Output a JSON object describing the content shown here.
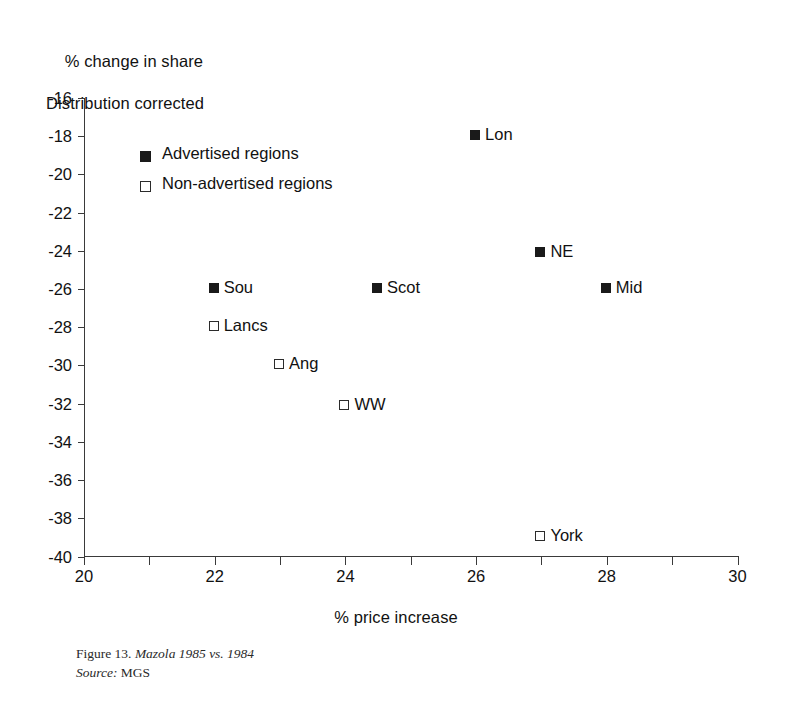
{
  "chart_data": {
    "type": "scatter",
    "title": "",
    "ylabel_line1": "% change in share",
    "ylabel_line2": "Distribution corrected",
    "xlabel": "% price increase",
    "xlim": [
      20,
      30
    ],
    "ylim": [
      -40,
      -16
    ],
    "xticks": [
      20,
      21,
      22,
      23,
      24,
      25,
      26,
      27,
      28,
      29,
      30
    ],
    "xtick_labels": [
      "20",
      "",
      "22",
      "",
      "24",
      "",
      "26",
      "",
      "28",
      "",
      "30"
    ],
    "yticks": [
      -16,
      -18,
      -20,
      -22,
      -24,
      -26,
      -28,
      -30,
      -32,
      -34,
      -36,
      -38,
      -40
    ],
    "ytick_labels": [
      "-16",
      "-18",
      "-20",
      "-22",
      "-24",
      "-26",
      "-28",
      "-30",
      "-32",
      "-34",
      "-36",
      "-38",
      "-40"
    ],
    "grid": false,
    "legend_position": "upper-left-inside",
    "series": [
      {
        "name": "Advertised regions",
        "marker": "filled-square",
        "points": [
          {
            "label": "Lon",
            "x": 26.0,
            "y": -18.0
          },
          {
            "label": "NE",
            "x": 27.0,
            "y": -24.1
          },
          {
            "label": "Mid",
            "x": 28.0,
            "y": -26.0
          },
          {
            "label": "Scot",
            "x": 24.5,
            "y": -26.0
          },
          {
            "label": "Sou",
            "x": 22.0,
            "y": -26.0
          }
        ]
      },
      {
        "name": "Non-advertised regions",
        "marker": "open-square",
        "points": [
          {
            "label": "Lancs",
            "x": 22.0,
            "y": -28.0
          },
          {
            "label": "Ang",
            "x": 23.0,
            "y": -30.0
          },
          {
            "label": "WW",
            "x": 24.0,
            "y": -32.1
          },
          {
            "label": "York",
            "x": 27.0,
            "y": -39.0
          }
        ]
      }
    ]
  },
  "legend": {
    "entries": [
      {
        "label": "Advertised regions",
        "marker": "filled-square"
      },
      {
        "label": "Non-advertised regions",
        "marker": "open-square"
      }
    ]
  },
  "caption": {
    "figure_number": "Figure 13.",
    "figure_title": "Mazola 1985 vs. 1984",
    "source_label": "Source:",
    "source_value": "MGS"
  }
}
